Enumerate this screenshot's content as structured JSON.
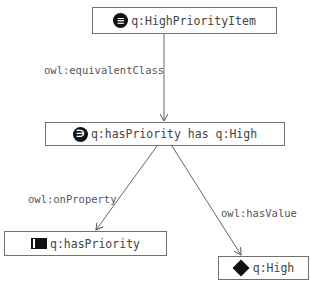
{
  "diagram": {
    "nodes": [
      {
        "id": "high-priority-item",
        "label": "q:HighPriorityItem",
        "icon": "equivalent-class-icon",
        "icon_glyph": "≡"
      },
      {
        "id": "restriction",
        "label": "q:hasPriority has q:High",
        "icon": "has-value-restriction-icon",
        "icon_glyph": "∋"
      },
      {
        "id": "has-priority",
        "label": "q:hasPriority",
        "icon": "object-property-icon"
      },
      {
        "id": "high",
        "label": "q:High",
        "icon": "individual-diamond-icon"
      }
    ],
    "edges": [
      {
        "from": "high-priority-item",
        "to": "restriction",
        "label": "owl:equivalentClass"
      },
      {
        "from": "restriction",
        "to": "has-priority",
        "label": "owl:onProperty"
      },
      {
        "from": "restriction",
        "to": "high",
        "label": "owl:hasValue"
      }
    ]
  },
  "colors": {
    "border": "#707070",
    "icon": "#111111",
    "text": "#444444",
    "edge": "#666666"
  }
}
